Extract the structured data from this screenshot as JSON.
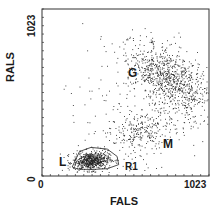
{
  "chart_data": {
    "type": "scatter",
    "title": "",
    "xlabel": "FALS",
    "ylabel": "RALS",
    "xlim": [
      0,
      1023
    ],
    "ylim": [
      0,
      1023
    ],
    "x_ticks_labels": [
      "0",
      "1023"
    ],
    "y_ticks_labels": [
      "0",
      "1023"
    ],
    "grid": false,
    "legend": null,
    "annotations": [
      {
        "text": "G",
        "x": 560,
        "y": 590,
        "meaning": "granulocytes"
      },
      {
        "text": "M",
        "x": 760,
        "y": 210,
        "meaning": "monocytes"
      },
      {
        "text": "L",
        "x": 150,
        "y": 60,
        "meaning": "lymphocytes"
      },
      {
        "text": "R1",
        "x": 500,
        "y": 35,
        "meaning": "gate region"
      }
    ],
    "clusters": [
      {
        "name": "G",
        "center_x": 780,
        "center_y": 590,
        "sd_x": 85,
        "sd_y": 150,
        "rotation_deg": 55,
        "n": 900
      },
      {
        "name": "M",
        "center_x": 620,
        "center_y": 270,
        "sd_x": 110,
        "sd_y": 60,
        "rotation_deg": 20,
        "n": 260
      },
      {
        "name": "L",
        "center_x": 300,
        "center_y": 95,
        "sd_x": 55,
        "sd_y": 28,
        "rotation_deg": 5,
        "n": 650
      },
      {
        "name": "background",
        "center_x": 520,
        "center_y": 420,
        "sd_x": 260,
        "sd_y": 280,
        "rotation_deg": 0,
        "n": 160
      }
    ],
    "gate_R1_polygon": [
      [
        185,
        55
      ],
      [
        230,
        150
      ],
      [
        300,
        175
      ],
      [
        400,
        165
      ],
      [
        460,
        120
      ],
      [
        470,
        70
      ],
      [
        400,
        45
      ],
      [
        300,
        40
      ],
      [
        220,
        42
      ]
    ]
  },
  "labels": {
    "ylabel": "RALS",
    "xlabel": "FALS",
    "y_max": "1023",
    "y_min": "0",
    "x_min": "0",
    "x_max": "1023",
    "G": "G",
    "M": "M",
    "L": "L",
    "R1": "R1"
  }
}
